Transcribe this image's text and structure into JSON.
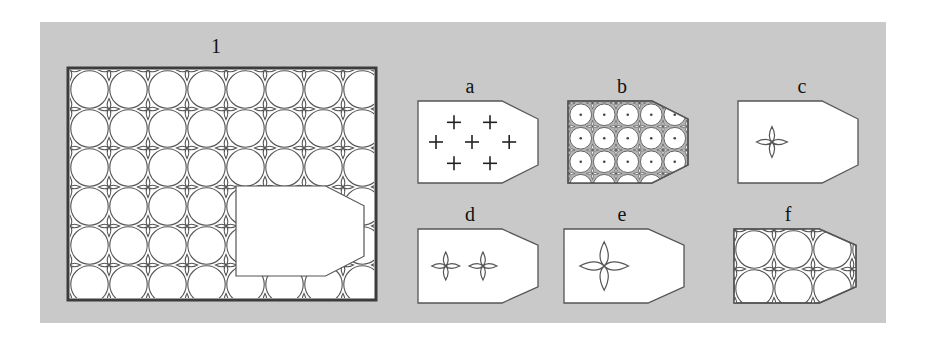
{
  "figure": {
    "background_color": "#c9c9c9",
    "page_color": "#ffffff",
    "line_color": "#555555",
    "frame_color": "#3c3c3c",
    "fill_color": "#ffffff",
    "plate": {
      "x": 40,
      "y": 22,
      "width": 846,
      "height": 301
    }
  },
  "panels": [
    {
      "id": "1",
      "label": "1",
      "kind": "framed-tiling-with-cutout",
      "description": "Large framed rectangle filled with a square lattice of touching circles forming four-pointed star interstices; a blank arrow-shaped (pentagonal) region is cut out over the right-centre of the tiling.",
      "rect": {
        "x": 66,
        "y": 66,
        "width": 312,
        "height": 236
      },
      "grid": {
        "cols": 8,
        "rows": 6,
        "cell": 39
      },
      "cutout": {
        "shape": "arrow-pentagon",
        "x": 170,
        "y": 120,
        "width": 128,
        "height": 90
      }
    },
    {
      "id": "a",
      "label": "a",
      "kind": "motif-plus-signs",
      "description": "Arrow-shaped tile containing seven small plus signs marking lattice node positions.",
      "rect": {
        "x": 416,
        "y": 99,
        "width": 124,
        "height": 86
      },
      "marker_count": 7,
      "markers": [
        {
          "x": 0.3,
          "y": 0.26
        },
        {
          "x": 0.6,
          "y": 0.26
        },
        {
          "x": 0.15,
          "y": 0.5
        },
        {
          "x": 0.45,
          "y": 0.5
        },
        {
          "x": 0.76,
          "y": 0.5
        },
        {
          "x": 0.3,
          "y": 0.76
        },
        {
          "x": 0.6,
          "y": 0.76
        }
      ]
    },
    {
      "id": "b",
      "label": "b",
      "kind": "dotted-circle-packing",
      "description": "Arrow-shaped tile filled with a dense packing of outlined circles, each with a centre dot, on a shaded background showing the underlying tiling.",
      "rect": {
        "x": 566,
        "y": 99,
        "width": 124,
        "height": 86
      },
      "grid": {
        "cols": 5,
        "rows": 3
      },
      "shaded": true
    },
    {
      "id": "c",
      "label": "c",
      "kind": "single-star-motif",
      "description": "Arrow-shaped tile with one small four-pointed star motif at the left-centre.",
      "rect": {
        "x": 736,
        "y": 99,
        "width": 124,
        "height": 86
      },
      "motif_count": 1,
      "motif_scale": 0.3
    },
    {
      "id": "d",
      "label": "d",
      "kind": "double-star-motif",
      "description": "Arrow-shaped tile with two four-pointed star motifs side by side.",
      "rect": {
        "x": 416,
        "y": 227,
        "width": 124,
        "height": 78
      },
      "motif_count": 2,
      "motif_scale": 0.3
    },
    {
      "id": "e",
      "label": "e",
      "kind": "large-star-motif",
      "description": "Arrow-shaped tile with a single large four-pointed star motif at the centre-left.",
      "rect": {
        "x": 562,
        "y": 227,
        "width": 124,
        "height": 78
      },
      "motif_count": 1,
      "motif_scale": 0.52
    },
    {
      "id": "f",
      "label": "f",
      "kind": "full-tiling",
      "description": "Arrow-shaped tile completely filled with the same circle-and-star lattice as panel 1.",
      "rect": {
        "x": 732,
        "y": 227,
        "width": 126,
        "height": 78
      },
      "grid": {
        "cols": 3,
        "rows": 2,
        "cell": 39
      }
    }
  ]
}
